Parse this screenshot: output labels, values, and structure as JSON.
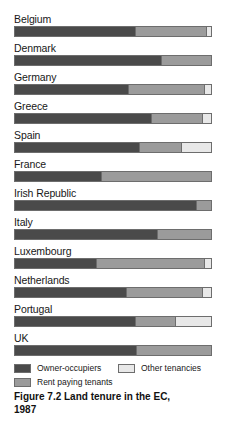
{
  "chart_data": {
    "type": "bar",
    "orientation": "horizontal",
    "stacked": true,
    "normalized_percent": true,
    "title": "Figure 7.2 Land tenure in the EC, 1987",
    "title_line1": "Figure 7.2  Land tenure in the EC,",
    "title_line2": "1987",
    "xlabel": "",
    "ylabel": "",
    "xlim": [
      0,
      100
    ],
    "grid": false,
    "legend_position": "bottom",
    "categories": [
      "Belgium",
      "Denmark",
      "Germany",
      "Greece",
      "Spain",
      "France",
      "Irish Republic",
      "Italy",
      "Luxembourg",
      "Netherlands",
      "Portugal",
      "UK"
    ],
    "series": [
      {
        "name": "Owner-occupiers",
        "color": "#4a4a4a",
        "values": [
          62,
          75,
          58,
          70,
          64,
          44,
          93,
          73,
          42,
          57,
          62,
          62
        ]
      },
      {
        "name": "Rent paying tenants",
        "color": "#9b9b9b",
        "values": [
          36,
          25,
          39,
          26,
          21,
          56,
          7,
          27,
          55,
          39,
          20,
          38
        ]
      },
      {
        "name": "Other tenancies",
        "color": "#e8e8e8",
        "values": [
          2,
          0,
          3,
          4,
          15,
          0,
          0,
          0,
          3,
          4,
          18,
          0
        ]
      }
    ],
    "legend": [
      {
        "label": "Owner-occupiers",
        "color": "#4a4a4a",
        "swatch": "owner-occupiers-swatch"
      },
      {
        "label": "Other tenancies",
        "color": "#e8e8e8",
        "swatch": "other-tenancies-swatch"
      },
      {
        "label": "Rent paying tenants",
        "color": "#9b9b9b",
        "swatch": "rent-paying-tenants-swatch"
      }
    ]
  }
}
